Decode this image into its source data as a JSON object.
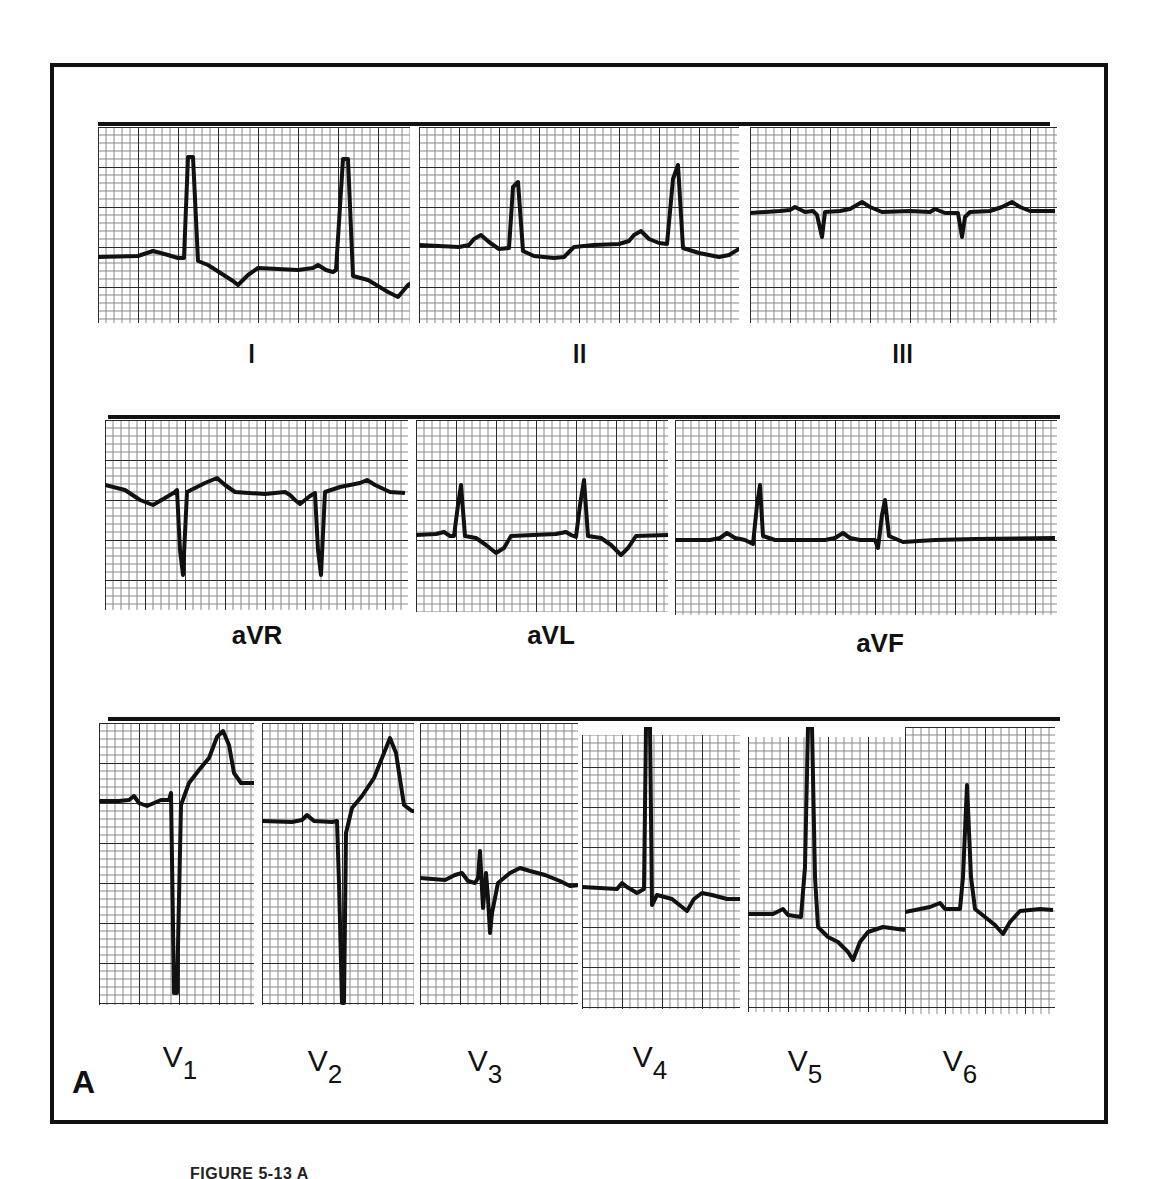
{
  "figure": {
    "panel_letter": "A",
    "caption": "FIGURE 5-13 A",
    "colors": {
      "ink": "#111111",
      "paper": "#ffffff",
      "grid_minor": "#9a9a9a",
      "grid_major": "#333333"
    }
  },
  "rows": [
    {
      "leads": [
        {
          "id": "I",
          "label": "I"
        },
        {
          "id": "II",
          "label": "II"
        },
        {
          "id": "III",
          "label": "III"
        }
      ]
    },
    {
      "leads": [
        {
          "id": "aVR",
          "label": "aVR"
        },
        {
          "id": "aVL",
          "label": "aVL"
        },
        {
          "id": "aVF",
          "label": "aVF"
        }
      ]
    },
    {
      "leads": [
        {
          "id": "V1",
          "label": "V",
          "sub": "1"
        },
        {
          "id": "V2",
          "label": "V",
          "sub": "2"
        },
        {
          "id": "V3",
          "label": "V",
          "sub": "3"
        },
        {
          "id": "V4",
          "label": "V",
          "sub": "4"
        },
        {
          "id": "V5",
          "label": "V",
          "sub": "5"
        },
        {
          "id": "V6",
          "label": "V",
          "sub": "6"
        }
      ]
    }
  ],
  "chart_data": {
    "type": "line",
    "xlabel": "",
    "ylabel": "",
    "grid": true,
    "units_note": "traces given in panel pixel coordinates (x right, y down)",
    "series": [
      {
        "name": "I",
        "points": "0,130 40,129 55,124 70,128 80,131 86,131 90,30 95,30 100,134 110,138 135,154 140,158 150,148 160,141 200,143 215,141 220,138 228,143 235,145 238,143 245,32 250,32 255,149 270,153 290,165 300,170 310,158 320,152 345,152"
      },
      {
        "name": "II",
        "points": "0,118 40,120 50,118 55,112 62,108 70,115 80,122 90,121 94,60 99,55 104,124 115,129 135,131 145,130 155,120 175,118 200,117 210,114 215,108 222,104 230,112 240,116 248,117 254,52 259,38 264,121 280,126 300,130 310,128 320,122 345,121"
      },
      {
        "name": "III",
        "points": "0,86 30,84 40,83 45,80 55,85 63,84 67,88 72,110 75,85 90,84 100,82 112,75 120,80 132,85 160,84 180,85 185,82 195,86 208,86 212,110 215,90 220,85 240,84 252,80 262,75 270,80 280,84 305,84"
      },
      {
        "name": "aVR",
        "points": "0,65 20,70 35,80 48,85 60,78 70,72 72,70 75,130 78,155 82,72 90,68 100,63 112,58 120,65 130,72 160,74 180,72 185,75 190,80 195,84 205,76 210,73 213,130 216,155 220,72 235,67 255,63 262,60 270,65 285,72 300,73"
      },
      {
        "name": "aVL",
        "points": "0,115 20,114 28,112 34,116 38,116 42,85 45,65 49,116 60,118 70,125 80,133 88,128 95,116 140,114 150,112 155,115 160,117 164,85 168,60 172,116 185,118 195,125 205,135 212,128 220,116 252,115"
      },
      {
        "name": "aVF",
        "points": "0,120 35,120 45,118 52,113 60,118 70,120 78,124 82,85 85,65 88,116 100,120 150,120 160,118 168,113 175,118 185,120 200,120 203,128 207,95 210,80 214,116 228,122 260,120 300,119 380,118"
      },
      {
        "name": "V1",
        "points": "0,78 20,78 30,77 35,73 40,80 48,83 62,77 70,77 72,70 75,270 78,270 82,82 90,60 100,47 110,35 118,14 124,8 130,22 135,50 142,60 160,60"
      },
      {
        "name": "V2",
        "points": "0,98 30,99 40,97 45,92 52,98 70,99 75,98 77,160 80,280 82,280 84,110 90,85 100,73 112,55 122,30 128,15 134,30 142,82 150,88 158,88"
      },
      {
        "name": "V3",
        "points": "0,155 25,157 35,152 42,150 48,158 55,160 58,155 60,128 63,185 66,150 68,175 70,210 72,190 78,160 90,150 100,145 110,148 125,152 140,158 150,163 160,162"
      },
      {
        "name": "V4",
        "points": "0,160 35,162 40,156 45,160 55,166 62,162 64,0 68,0 70,178 75,168 90,172 100,180 105,184 112,172 120,166 130,168 145,172 158,172"
      },
      {
        "name": "V5",
        "points": "0,187 25,187 35,182 40,188 53,190 57,140 60,0 64,0 67,150 70,200 80,210 90,215 100,225 105,233 112,215 120,205 135,200 150,202 157,203"
      },
      {
        "name": "V6",
        "points": "0,185 25,180 35,176 40,182 55,182 58,150 62,58 66,150 70,182 80,190 90,198 98,207 105,195 115,184 135,182 148,183"
      }
    ]
  }
}
